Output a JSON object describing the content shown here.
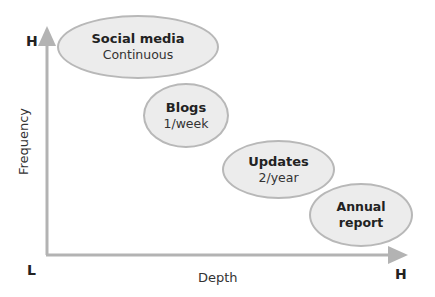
{
  "diagram": {
    "axes": {
      "y_label": "Frequency",
      "x_label": "Depth",
      "y_high": "H",
      "origin": "L",
      "x_high": "H",
      "axis_color": "#b3b3b3"
    },
    "bubbles": [
      {
        "title": "Social media",
        "subtitle": "Continuous"
      },
      {
        "title": "Blogs",
        "subtitle": "1/week"
      },
      {
        "title": "Updates",
        "subtitle": "2/year"
      },
      {
        "title": "Annual",
        "subtitle": "report"
      }
    ],
    "colors": {
      "bubble_fill": "#ececec",
      "bubble_border": "#b8b8b8"
    }
  }
}
